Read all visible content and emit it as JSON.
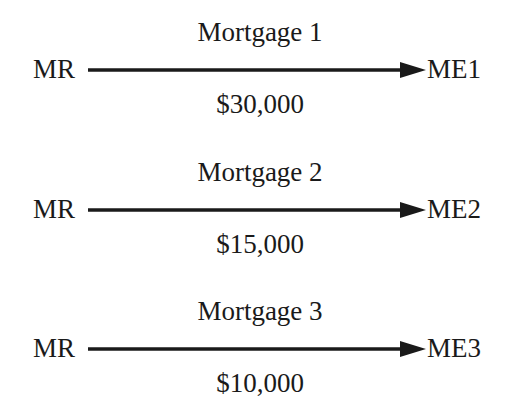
{
  "diagram": {
    "edges": [
      {
        "title": "Mortgage 1",
        "source": "MR",
        "target": "ME1",
        "amount": "$30,000"
      },
      {
        "title": "Mortgage 2",
        "source": "MR",
        "target": "ME2",
        "amount": "$15,000"
      },
      {
        "title": "Mortgage 3",
        "source": "MR",
        "target": "ME3",
        "amount": "$10,000"
      }
    ],
    "colors": {
      "ink": "#1a1a1a",
      "background": "#ffffff"
    }
  }
}
